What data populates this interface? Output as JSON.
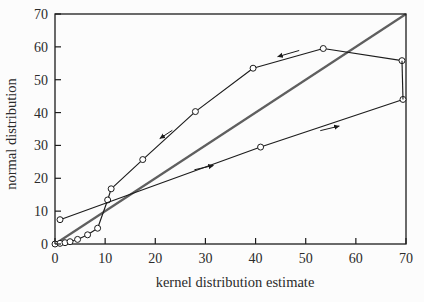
{
  "figure": {
    "width": 424,
    "height": 302
  },
  "colors": {
    "curve": "#1c1c1c",
    "identity_line": "#5f5f5f",
    "marker_fill": "#ffffff",
    "frame": "#1c1c1c",
    "text": "#2b2b2b",
    "background": "#fcfcfc"
  },
  "chart_data": {
    "type": "line",
    "title": "",
    "xlabel": "kernel distribution estimate",
    "ylabel": "normal distribution",
    "xlim": [
      0,
      70
    ],
    "ylim": [
      0,
      70
    ],
    "xticks": [
      0,
      10,
      20,
      30,
      40,
      50,
      60,
      70
    ],
    "yticks": [
      0,
      10,
      20,
      30,
      40,
      50,
      60,
      70
    ],
    "grid": false,
    "legend": "none",
    "series": [
      {
        "name": "upper-branch",
        "marker": "open-circle",
        "direction": "traversed right-to-left (arrows point left)",
        "points": [
          [
            0,
            0
          ],
          [
            1,
            0.2
          ],
          [
            2,
            0.4
          ],
          [
            3,
            0.7
          ],
          [
            4.5,
            1.4
          ],
          [
            6.5,
            2.8
          ],
          [
            8.5,
            4.8
          ],
          [
            10.5,
            13.4
          ],
          [
            11.2,
            16.8
          ],
          [
            17.5,
            25.7
          ],
          [
            28,
            40.3
          ],
          [
            39.5,
            53.5
          ],
          [
            53.5,
            59.5
          ],
          [
            69.2,
            55.8
          ]
        ]
      },
      {
        "name": "lower-branch",
        "marker": "open-circle",
        "direction": "traversed left-to-right (arrows point right)",
        "points": [
          [
            1,
            7.4
          ],
          [
            41,
            29.5
          ],
          [
            69.4,
            44
          ]
        ]
      },
      {
        "name": "right-edge-connector",
        "marker": "none",
        "points": [
          [
            69.2,
            55.8
          ],
          [
            69.4,
            44
          ]
        ]
      },
      {
        "name": "identity-reference-line",
        "marker": "none",
        "points": [
          [
            0,
            0
          ],
          [
            70,
            70
          ]
        ]
      }
    ],
    "arrows": [
      {
        "name": "upper-branch-arrow",
        "from": [
          48.7,
          58.9
        ],
        "to": [
          44.4,
          57.0
        ]
      },
      {
        "name": "steep-section-arrow",
        "from": [
          23.4,
          34.6
        ],
        "to": [
          20.9,
          32.1
        ]
      },
      {
        "name": "lower-branch-arrow-left",
        "from": [
          27.8,
          22.6
        ],
        "to": [
          31.6,
          23.9
        ]
      },
      {
        "name": "lower-branch-arrow-right",
        "from": [
          52.9,
          34.5
        ],
        "to": [
          56.7,
          35.9
        ]
      }
    ],
    "plot_area_px": {
      "left": 55,
      "top": 14,
      "right": 406,
      "bottom": 244
    }
  }
}
